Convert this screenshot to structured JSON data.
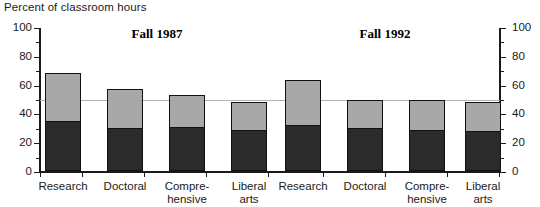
{
  "caption": "Percent of classroom hours",
  "chart_data": {
    "type": "bar",
    "title": "Percent of classroom hours",
    "subtype": "stacked-bar-grouped",
    "xlabel": "",
    "ylabel": "Percent of classroom hours",
    "ylim": [
      0,
      100
    ],
    "yticks": [
      0,
      20,
      40,
      60,
      80,
      100
    ],
    "ytick_labels": [
      "0",
      "20",
      "40",
      "60",
      "80",
      "100"
    ],
    "y_minor_ticks": [
      10,
      30,
      50,
      70,
      90
    ],
    "grid": "horizontal-reference-line-at-50",
    "reference_line": 50,
    "dual_axis": true,
    "right_ytick_labels": [
      "0",
      "20",
      "40",
      "60",
      "80",
      "100"
    ],
    "legend": "none",
    "categories": [
      "Research",
      "Doctoral",
      "Comprehensive",
      "Liberal arts"
    ],
    "panels": [
      {
        "label": "Fall 1987",
        "series": [
          {
            "name": "lower-segment",
            "color": "#2b2b2b",
            "values": [
              34,
              29,
              30,
              28
            ]
          },
          {
            "name": "upper-segment",
            "color": "#a8a8a8",
            "values": [
              34,
              28,
              23,
              20
            ]
          }
        ],
        "totals": [
          68,
          57,
          53,
          48
        ]
      },
      {
        "label": "Fall 1992",
        "series": [
          {
            "name": "lower-segment",
            "color": "#2b2b2b",
            "values": [
              31,
              29,
              28,
              27
            ]
          },
          {
            "name": "upper-segment",
            "color": "#a8a8a8",
            "values": [
              32,
              20,
              21,
              21
            ]
          }
        ],
        "totals": [
          63,
          49,
          49,
          48
        ]
      }
    ]
  },
  "axis": {
    "left_labels": [
      "100",
      "80",
      "60",
      "40",
      "20",
      "0"
    ],
    "right_labels": [
      "100",
      "80",
      "60",
      "40",
      "20",
      "0"
    ]
  },
  "panel_titles": {
    "first": "Fall 1987",
    "second": "Fall 1992"
  },
  "category_labels": [
    {
      "line1": "Research",
      "line2": ""
    },
    {
      "line1": "Doctoral",
      "line2": ""
    },
    {
      "line1": "Compre-",
      "line2": "hensive"
    },
    {
      "line1": "Liberal",
      "line2": "arts"
    },
    {
      "line1": "Research",
      "line2": ""
    },
    {
      "line1": "Doctoral",
      "line2": ""
    },
    {
      "line1": "Compre-",
      "line2": "hensive"
    },
    {
      "line1": "Liberal",
      "line2": "arts"
    }
  ],
  "colors": {
    "upper_segment": "#a8a8a8",
    "lower_segment": "#2b2b2b",
    "axis": "#1a1a1a",
    "gridline": "#b4b4b4",
    "background": "#ffffff"
  }
}
